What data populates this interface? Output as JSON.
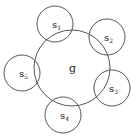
{
  "diagram": {
    "stroke_color": "#555555",
    "center_circle": {
      "label": "g",
      "cx": 72,
      "cy": 68,
      "r": 38
    },
    "satellites": [
      {
        "label": "s",
        "sub": "1",
        "cx": 55,
        "cy": 24,
        "r": 18
      },
      {
        "label": "s",
        "sub": "2",
        "cx": 107,
        "cy": 37,
        "r": 18
      },
      {
        "label": "s",
        "sub": "3",
        "cx": 112,
        "cy": 88,
        "r": 18
      },
      {
        "label": "s",
        "sub": "4",
        "cx": 63,
        "cy": 115,
        "r": 18
      },
      {
        "label": "s",
        "sub": "5",
        "cx": 22,
        "cy": 73,
        "r": 18
      }
    ]
  }
}
